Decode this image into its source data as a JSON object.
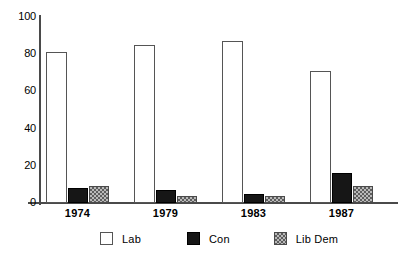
{
  "chart_data": {
    "type": "bar",
    "title": "",
    "subtitle": "",
    "xlabel": "",
    "ylabel": "",
    "categories": [
      "1974",
      "1979",
      "1983",
      "1987"
    ],
    "series": [
      {
        "name": "Lab",
        "values": [
          81,
          85,
          87,
          71
        ],
        "style": "white-outline"
      },
      {
        "name": "Con",
        "values": [
          8,
          7,
          5,
          16
        ],
        "style": "solid-black"
      },
      {
        "name": "Lib Dem",
        "values": [
          9,
          4,
          4,
          9
        ],
        "style": "gray-checkered"
      }
    ],
    "ylim": [
      0,
      100
    ],
    "yticks": [
      0,
      20,
      40,
      60,
      80,
      100
    ],
    "ytick_labels": [
      "0",
      "20",
      "40",
      "60",
      "80",
      "100"
    ],
    "grid": false,
    "legend_position": "bottom"
  },
  "legend": {
    "items": [
      {
        "label": "Lab",
        "swatch": "white-outline-swatch"
      },
      {
        "label": "Con",
        "swatch": "solid-black-swatch"
      },
      {
        "label": "Lib Dem",
        "swatch": "gray-checkered-swatch"
      }
    ]
  },
  "colors": {
    "lab": "#ffffff",
    "con": "#161616",
    "lib_dem": "#b9b9b9",
    "axis": "#4a4a4a",
    "text": "#000000",
    "background": "#ffffff"
  }
}
